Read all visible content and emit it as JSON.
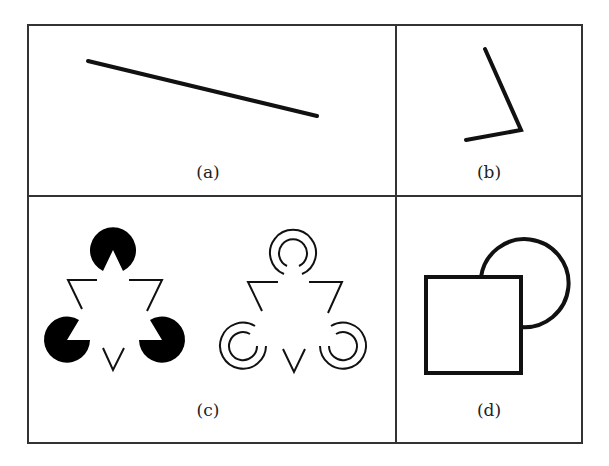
{
  "figure": {
    "panels": [
      {
        "id": "a",
        "label": "(a)",
        "content": "single straight line segment"
      },
      {
        "id": "b",
        "label": "(b)",
        "content": "two line segments forming an angle"
      },
      {
        "id": "c",
        "label": "(c)",
        "content": "Kanizsa illusory triangle: pac-man inducers and concentric-arc inducers"
      },
      {
        "id": "d",
        "label": "(d)",
        "content": "square occluding a circle"
      }
    ],
    "colors": {
      "stroke": "#111111",
      "border": "#333333",
      "background": "#ffffff"
    }
  }
}
